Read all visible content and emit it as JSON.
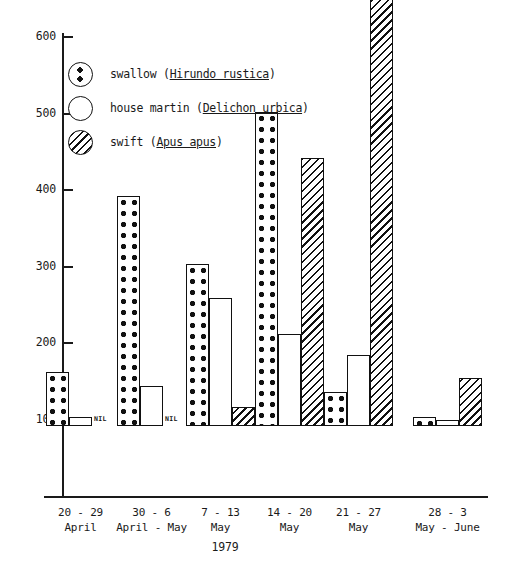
{
  "chart_data": {
    "type": "bar",
    "title": "",
    "xlabel": "1979",
    "ylabel": "",
    "ylim": [
      0,
      600
    ],
    "ytick_step": 100,
    "yticks": [
      0,
      100,
      200,
      300,
      400,
      500,
      600
    ],
    "grid": false,
    "legend_position": "upper-left-inside",
    "categories": [
      "20 - 29 April",
      "30 - 6 April - May",
      "7 - 13 May",
      "14 - 20 May",
      "21 - 27 May",
      "28 - 3 May - June"
    ],
    "series": [
      {
        "name": "swallow",
        "values": [
          70,
          301,
          212,
          410,
          45,
          12
        ]
      },
      {
        "name": "house martin",
        "values": [
          12,
          52,
          167,
          120,
          93,
          8
        ]
      },
      {
        "name": "swift",
        "values": [
          0,
          0,
          25,
          350,
          600,
          63
        ]
      }
    ],
    "annotations": [
      {
        "text": "NIL",
        "category": "20 - 29 April",
        "series": "swift"
      },
      {
        "text": "NIL",
        "category": "30 - 6 April - May",
        "series": "swift"
      }
    ]
  },
  "axis": {
    "y_tick_labels": [
      "600",
      "500",
      "400",
      "300",
      "200",
      "100"
    ],
    "year_label": "1979"
  },
  "categories": [
    {
      "line1": "20 - 29",
      "line2": "April"
    },
    {
      "line1": "30 - 6",
      "line2": "April - May"
    },
    {
      "line1": "7 - 13",
      "line2": "May"
    },
    {
      "line1": "14 - 20",
      "line2": "May"
    },
    {
      "line1": "21 - 27",
      "line2": "May"
    },
    {
      "line1": "28 - 3",
      "line2": "May - June"
    }
  ],
  "legend": {
    "items": [
      {
        "swatch": "dotted-circle-icon",
        "common_name": "swallow (",
        "scientific_name": "Hirundo rustica",
        "close": ")"
      },
      {
        "swatch": "open-circle-icon",
        "common_name": "house martin (",
        "scientific_name": "Delichon urbica",
        "close": ")"
      },
      {
        "swatch": "hatched-circle-icon",
        "common_name": "swift (",
        "scientific_name": "Apus apus",
        "close": ")"
      }
    ]
  },
  "nil_markers": [
    {
      "label": "NIL"
    },
    {
      "label": "NIL"
    }
  ],
  "colors": {
    "ink": "#1a1a1a",
    "background": "#ffffff"
  }
}
